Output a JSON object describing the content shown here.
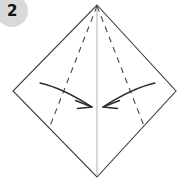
{
  "diagram": {
    "kind": "origami-fold-step",
    "background_color": "#ffffff",
    "step_badge": {
      "label": "2",
      "circle_fill": "#d9d9d9",
      "text_color": "#111111",
      "center_x": 12,
      "center_y": 11,
      "radius": 16
    },
    "paper_outline": {
      "name": "square-rotated-45",
      "stroke_color": "#3a3a42",
      "stroke_width": 1.1,
      "fill": "#ffffff",
      "points": "97,5 176,91 97,177 13,91",
      "vertices": {
        "top": [
          97,
          5
        ],
        "right": [
          176,
          91
        ],
        "bottom": [
          97,
          177
        ],
        "left": [
          13,
          91
        ]
      }
    },
    "center_line": {
      "name": "vertical-center-crease",
      "stroke_color": "#b9b9bd",
      "stroke_width": 1.1,
      "x1": 97,
      "y1": 6,
      "x2": 97,
      "y2": 176
    },
    "fold_lines": [
      {
        "name": "left-fold-crease",
        "style": "dashed",
        "stroke_color": "#4a4a52",
        "stroke_width": 1.1,
        "dash_pattern": "6 5",
        "x1": 97,
        "y1": 6,
        "x2": 50,
        "y2": 126
      },
      {
        "name": "right-fold-crease",
        "style": "dashed",
        "stroke_color": "#4a4a52",
        "stroke_width": 1.1,
        "dash_pattern": "6 5",
        "x1": 97,
        "y1": 6,
        "x2": 144,
        "y2": 126
      }
    ],
    "arrows": [
      {
        "name": "left-fold-arrow",
        "direction": "inward-right",
        "stroke_color": "#2b2b33",
        "stroke_width": 1.4,
        "path": "M 40,83 C 58,87 78,98 92,107",
        "head": "M 92,107 L 76,101 M 92,107 L 78,108"
      },
      {
        "name": "right-fold-arrow",
        "direction": "inward-left",
        "stroke_color": "#2b2b33",
        "stroke_width": 1.4,
        "path": "M 155,83 C 137,87 117,98 103,107",
        "head": "M 103,107 L 119,101 M 103,107 L 117,108"
      }
    ]
  }
}
